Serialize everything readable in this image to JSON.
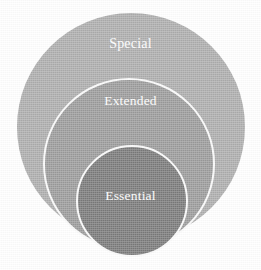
{
  "diagram": {
    "type": "concentric-circles",
    "title": "",
    "background_color": "#ffffff",
    "label_color": "#ffffff",
    "levels": [
      {
        "id": "special",
        "label": "Special",
        "rank": 3,
        "scope": "outermost",
        "fill_color": "#adadad",
        "border_color": "none",
        "diameter_px": 228
      },
      {
        "id": "extended",
        "label": "Extended",
        "rank": 2,
        "scope": "middle",
        "fill_color": "#9b9b9b",
        "border_color": "#fbfbfb",
        "diameter_px": 172
      },
      {
        "id": "essential",
        "label": "Essential",
        "rank": 1,
        "scope": "innermost",
        "fill_color": "#7a7a7a",
        "border_color": "#fbfbfb",
        "diameter_px": 112
      }
    ]
  },
  "chart_data": {
    "type": "pie",
    "title": "",
    "subtitle": "",
    "xlabel": "",
    "ylabel": "",
    "categories": [
      "Essential",
      "Extended",
      "Special"
    ],
    "values": [
      112,
      172,
      228
    ],
    "value_unit": "circle diameter (px)",
    "series": [
      {
        "name": "Nested scope levels",
        "values": [
          112,
          172,
          228
        ]
      }
    ],
    "colors": [
      "#7a7a7a",
      "#9b9b9b",
      "#adadad"
    ],
    "legend": false,
    "legend_position": "none",
    "grid": false,
    "annotations": [
      "Essential is contained within Extended",
      "Extended is contained within Special"
    ]
  }
}
